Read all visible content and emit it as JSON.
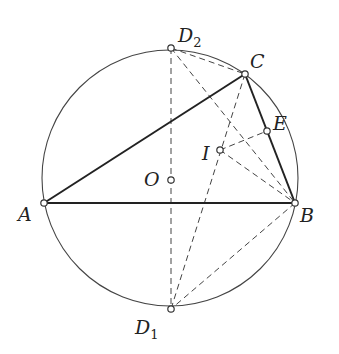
{
  "diagram": {
    "type": "geometry",
    "circle": {
      "name": "circumcircle",
      "center": "O",
      "cx": 170,
      "cy": 178,
      "r": 128
    },
    "points": [
      {
        "id": "A",
        "label": "A",
        "sub": "",
        "x": 44,
        "y": 203,
        "lx": 18,
        "ly": 221
      },
      {
        "id": "B",
        "label": "B",
        "sub": "",
        "x": 295,
        "y": 203,
        "lx": 300,
        "ly": 222
      },
      {
        "id": "C",
        "label": "C",
        "sub": "",
        "x": 245,
        "y": 74,
        "lx": 250,
        "ly": 68
      },
      {
        "id": "D1",
        "label": "D",
        "sub": "1",
        "x": 171,
        "y": 309,
        "lx": 135,
        "ly": 334
      },
      {
        "id": "D2",
        "label": "D",
        "sub": "2",
        "x": 171,
        "y": 48,
        "lx": 178,
        "ly": 42
      },
      {
        "id": "E",
        "label": "E",
        "sub": "",
        "x": 267,
        "y": 131,
        "lx": 273,
        "ly": 130
      },
      {
        "id": "I",
        "label": "I",
        "sub": "",
        "x": 220,
        "y": 150,
        "lx": 202,
        "ly": 160
      },
      {
        "id": "O",
        "label": "O",
        "sub": "",
        "x": 171,
        "y": 180,
        "lx": 144,
        "ly": 186
      }
    ],
    "solid_segments": [
      [
        "A",
        "C"
      ],
      [
        "A",
        "B"
      ],
      [
        "C",
        "B"
      ]
    ],
    "dashed_segments": [
      [
        "D2",
        "D1"
      ],
      [
        "D2",
        "C"
      ],
      [
        "D2",
        "B"
      ],
      [
        "C",
        "D1"
      ],
      [
        "I",
        "E"
      ],
      [
        "I",
        "B"
      ],
      [
        "B",
        "D1"
      ]
    ]
  }
}
